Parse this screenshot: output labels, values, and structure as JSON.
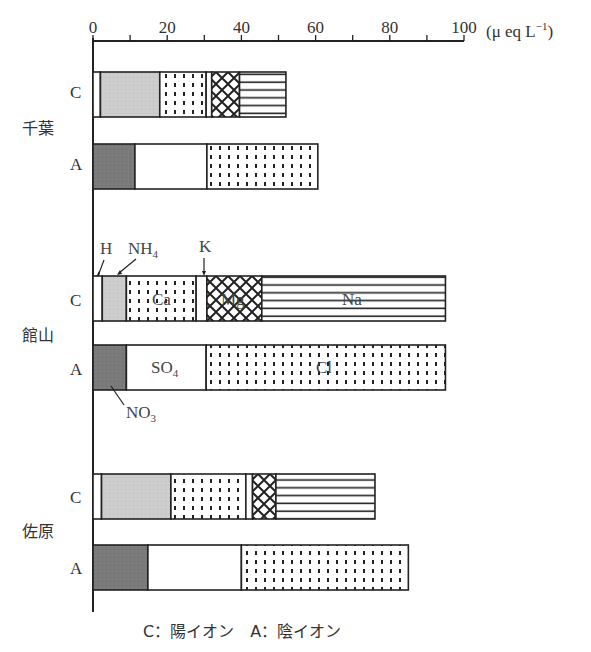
{
  "chart_data": {
    "type": "bar",
    "orientation": "horizontal-stacked",
    "title": "",
    "xlabel": "(μeq L⁻¹)",
    "xlim": [
      0,
      100
    ],
    "xticks": [
      0,
      20,
      40,
      60,
      80,
      100
    ],
    "xtick_labels": [
      "0",
      "20",
      "40",
      "60",
      "80",
      "100"
    ],
    "unit_label": "(μ eq L⁻¹)",
    "legend_caption": "C：陽イオン　A：陰イオン",
    "cation_components": [
      "H",
      "NH4",
      "Ca",
      "K",
      "Mg",
      "Na"
    ],
    "anion_components": [
      "NO3",
      "SO4",
      "Cl"
    ],
    "sites": [
      {
        "name": "千葉",
        "C": {
          "H": 2.0,
          "NH4": 16.0,
          "Ca": 12.5,
          "K": 1.5,
          "Mg": 7.5,
          "Na": 12.5,
          "total": 52
        },
        "A": {
          "NO3": 11.3,
          "SO4": 19.4,
          "Cl": 29.9,
          "total": 60.6
        }
      },
      {
        "name": "館山",
        "C": {
          "H": 2.5,
          "NH4": 6.5,
          "Ca": 18.8,
          "K": 2.9,
          "Mg": 14.8,
          "Na": 49.5,
          "total": 95
        },
        "A": {
          "NO3": 9.0,
          "SO4": 21.5,
          "Cl": 64.5,
          "total": 95
        }
      },
      {
        "name": "佐原",
        "C": {
          "H": 2.3,
          "NH4": 18.7,
          "Ca": 20.2,
          "K": 1.8,
          "Mg": 6.3,
          "Na": 26.7,
          "total": 76
        },
        "A": {
          "NO3": 14.8,
          "SO4": 25.2,
          "Cl": 45.0,
          "total": 85
        }
      }
    ],
    "row_labels": [
      "C",
      "A"
    ],
    "annotations": [
      "H",
      "NH4",
      "K",
      "Ca",
      "Mg",
      "Na",
      "SO4",
      "Cl",
      "NO3"
    ],
    "grid": false,
    "legend_position": "bottom"
  },
  "text": {
    "unit": "(μ eq L",
    "unit_sup": "−1",
    "unit_close": ")",
    "caption": "C：陽イオン　A：陰イオン",
    "row_c": "C",
    "row_a": "A",
    "site1": "千葉",
    "site2": "館山",
    "site3": "佐原",
    "ann_h": "H",
    "ann_nh4": "NH",
    "ann_nh4_sub": "4",
    "ann_k": "K",
    "ann_ca": "Ca",
    "ann_mg": "Mg",
    "ann_na": "Na",
    "ann_so4": "SO",
    "ann_so4_sub": "4",
    "ann_cl": "Cl",
    "ann_no3": "NO",
    "ann_no3_sub": "3"
  },
  "colors": {
    "H": "#ffffff",
    "NH4": "#cfcfcf",
    "NO3": "#7a7a7a",
    "SO4": "#ffffff",
    "outline": "#222222"
  }
}
